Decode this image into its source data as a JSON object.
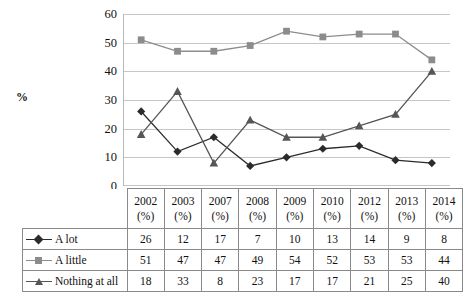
{
  "axis": {
    "y_label": "%",
    "y_ticks": [
      "0",
      "10",
      "20",
      "30",
      "40",
      "50",
      "60"
    ]
  },
  "colors": {
    "a_lot": "#2b2b2b",
    "a_little": "#8c8c8c",
    "nothing_at_all": "#565656",
    "gridline": "#c6c6c6",
    "table_border": "#8a8a8a",
    "text": "#111111"
  },
  "table": {
    "corner_label": "",
    "headers": [
      "2002\n(%)",
      "2003\n(%)",
      "2007\n(%)",
      "2008\n(%)",
      "2009\n(%)",
      "2010\n(%)",
      "2012\n(%)",
      "2013\n(%)",
      "2014\n(%)"
    ],
    "rows": [
      {
        "label": "A lot",
        "marker": "diamond",
        "values": [
          "26",
          "12",
          "17",
          "7",
          "10",
          "13",
          "14",
          "9",
          "8"
        ]
      },
      {
        "label": "A little",
        "marker": "square",
        "values": [
          "51",
          "47",
          "47",
          "49",
          "54",
          "52",
          "53",
          "53",
          "44"
        ]
      },
      {
        "label": "Nothing at all",
        "marker": "triangle",
        "values": [
          "18",
          "33",
          "8",
          "23",
          "17",
          "17",
          "21",
          "25",
          "40"
        ]
      }
    ]
  },
  "chart_data": {
    "type": "line",
    "title": "",
    "xlabel": "",
    "ylabel": "%",
    "ylim": [
      0,
      60
    ],
    "ytick_step": 10,
    "grid": "horizontal",
    "legend": "table-below",
    "categories": [
      "2002 (%)",
      "2003 (%)",
      "2007 (%)",
      "2008 (%)",
      "2009 (%)",
      "2010 (%)",
      "2012 (%)",
      "2013 (%)",
      "2014 (%)"
    ],
    "series": [
      {
        "name": "A lot",
        "marker": "diamond",
        "color": "#2b2b2b",
        "values": [
          26,
          12,
          17,
          7,
          10,
          13,
          14,
          9,
          8
        ]
      },
      {
        "name": "A little",
        "marker": "square",
        "color": "#8c8c8c",
        "values": [
          51,
          47,
          47,
          49,
          54,
          52,
          53,
          53,
          44
        ]
      },
      {
        "name": "Nothing at all",
        "marker": "triangle",
        "color": "#565656",
        "values": [
          18,
          33,
          8,
          23,
          17,
          17,
          21,
          25,
          40
        ]
      }
    ]
  }
}
